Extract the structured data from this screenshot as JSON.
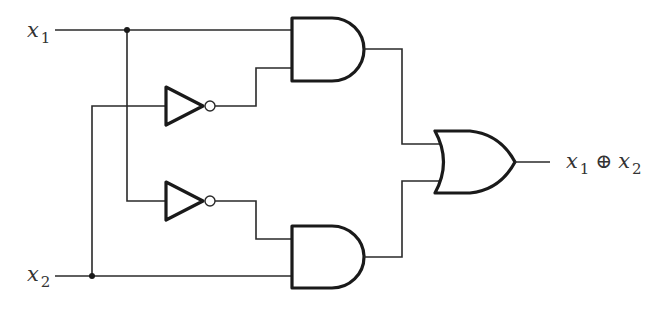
{
  "diagram": {
    "type": "logic-circuit",
    "colors": {
      "line": "#1a1a1a",
      "text": "#333333",
      "background": "#ffffff"
    },
    "inputs": [
      {
        "id": "x1",
        "var": "x",
        "sub": "1"
      },
      {
        "id": "x2",
        "var": "x",
        "sub": "2"
      }
    ],
    "output": {
      "id": "out",
      "parts": [
        {
          "var": "x",
          "sub": "1"
        },
        {
          "op": "⊕"
        },
        {
          "var": "x",
          "sub": "2"
        }
      ]
    },
    "gates": [
      {
        "id": "not1",
        "type": "NOT",
        "input": "x2"
      },
      {
        "id": "not2",
        "type": "NOT",
        "input": "x1"
      },
      {
        "id": "and1",
        "type": "AND",
        "inputs": [
          "x1",
          "not1"
        ]
      },
      {
        "id": "and2",
        "type": "AND",
        "inputs": [
          "not2",
          "x2"
        ]
      },
      {
        "id": "or1",
        "type": "OR",
        "inputs": [
          "and1",
          "and2"
        ],
        "output": "out"
      }
    ]
  }
}
